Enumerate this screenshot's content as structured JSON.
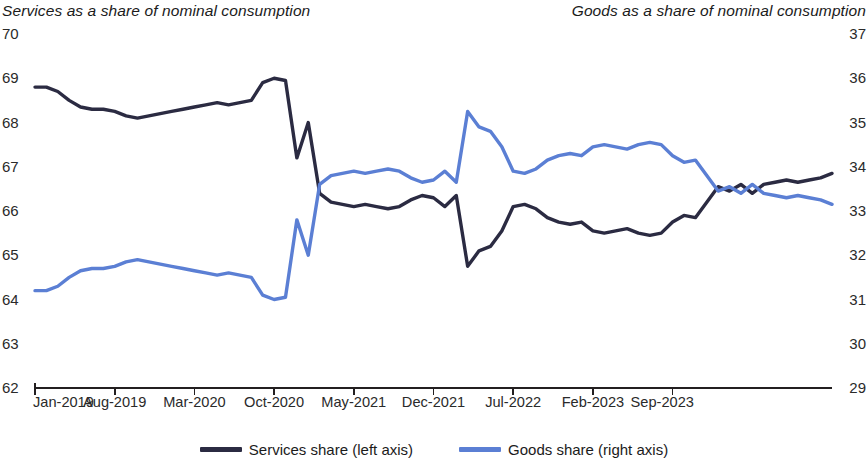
{
  "chart_data": {
    "type": "line",
    "title": "",
    "xlabel": "",
    "left_axis_title": "Services as a share of nominal consumption",
    "right_axis_title": "Goods as a share of nominal consumption",
    "grid": false,
    "legend_position": "bottom",
    "x_tick_labels": [
      "Jan-2019",
      "Aug-2019",
      "Mar-2020",
      "Oct-2020",
      "May-2021",
      "Dec-2021",
      "Jul-2022",
      "Feb-2023",
      "Sep-2023"
    ],
    "x_tick_indices": [
      0,
      7,
      14,
      21,
      28,
      35,
      42,
      49,
      56
    ],
    "x_start": "Jan-2019",
    "x_end": "Dec-2023",
    "n_points": 60,
    "left_axis": {
      "label": "Services share",
      "ticks": [
        62,
        63,
        64,
        65,
        66,
        67,
        68,
        69,
        70
      ],
      "ylim": [
        62,
        70
      ],
      "color": "#2b2b42"
    },
    "right_axis": {
      "label": "Goods share",
      "ticks": [
        29,
        30,
        31,
        32,
        33,
        34,
        35,
        36,
        37
      ],
      "ylim": [
        29,
        37
      ],
      "color": "#5b7fd4"
    },
    "series": [
      {
        "name": "Services share (left axis)",
        "axis": "left",
        "color": "#2b2b42",
        "values": [
          68.8,
          68.8,
          68.7,
          68.5,
          68.35,
          68.3,
          68.3,
          68.25,
          68.15,
          68.1,
          68.15,
          68.2,
          68.25,
          68.3,
          68.35,
          68.4,
          68.45,
          68.4,
          68.45,
          68.5,
          68.9,
          69.0,
          68.95,
          67.2,
          68.0,
          66.4,
          66.2,
          66.15,
          66.1,
          66.15,
          66.1,
          66.05,
          66.1,
          66.25,
          66.35,
          66.3,
          66.1,
          66.35,
          64.75,
          65.1,
          65.2,
          65.55,
          66.1,
          66.15,
          66.05,
          65.85,
          65.75,
          65.7,
          65.75,
          65.55,
          65.5,
          65.55,
          65.6,
          65.5,
          65.45,
          65.5,
          65.75,
          65.9,
          65.85,
          66.2,
          66.55,
          66.45,
          66.6,
          66.4,
          66.6,
          66.65,
          66.7,
          66.65,
          66.7,
          66.75,
          66.85
        ]
      },
      {
        "name": "Goods share (right axis)",
        "axis": "right",
        "color": "#5b7fd4",
        "values": [
          31.2,
          31.2,
          31.3,
          31.5,
          31.65,
          31.7,
          31.7,
          31.75,
          31.85,
          31.9,
          31.85,
          31.8,
          31.75,
          31.7,
          31.65,
          31.6,
          31.55,
          31.6,
          31.55,
          31.5,
          31.1,
          31.0,
          31.05,
          32.8,
          32.0,
          33.6,
          33.8,
          33.85,
          33.9,
          33.85,
          33.9,
          33.95,
          33.9,
          33.75,
          33.65,
          33.7,
          33.9,
          33.65,
          35.25,
          34.9,
          34.8,
          34.45,
          33.9,
          33.85,
          33.95,
          34.15,
          34.25,
          34.3,
          34.25,
          34.45,
          34.5,
          34.45,
          34.4,
          34.5,
          34.55,
          34.5,
          34.25,
          34.1,
          34.15,
          33.8,
          33.45,
          33.55,
          33.4,
          33.6,
          33.4,
          33.35,
          33.3,
          33.35,
          33.3,
          33.25,
          33.15
        ]
      }
    ]
  },
  "legend": {
    "items": [
      {
        "label": "Services share (left axis)",
        "color": "#2b2b42"
      },
      {
        "label": "Goods share (right axis)",
        "color": "#5b7fd4"
      }
    ]
  },
  "axis_style": {
    "line_color": "#231f20",
    "plot_left_px": 35,
    "plot_right_px": 832,
    "plot_top_px": 34,
    "plot_bottom_px": 388
  }
}
